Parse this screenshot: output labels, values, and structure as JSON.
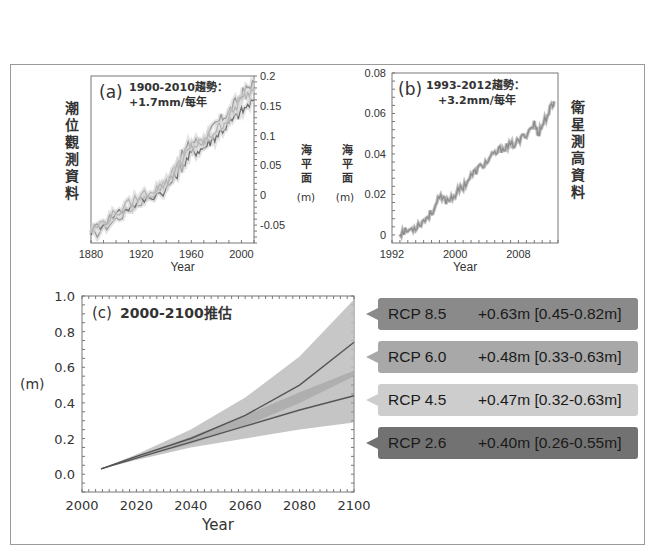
{
  "chart_data": [
    {
      "id": "a",
      "type": "line",
      "panel_label": "(a)",
      "title": "1900-2010趨勢：",
      "subtitle": "+1.7mm/每年",
      "left_vertical_label": "潮位觀測資料",
      "right_axis_label": "海平面",
      "right_axis_unit": "(m)",
      "xlabel": "Year",
      "xticks": [
        "1880",
        "1920",
        "1960",
        "2000"
      ],
      "xlim": [
        1880,
        2010
      ],
      "yticks": [
        "0.2",
        "0.15",
        "0.1",
        "0.05",
        "0",
        "-0.05"
      ],
      "ylim": [
        -0.08,
        0.2
      ],
      "y_axis_side": "right",
      "series": [
        {
          "name": "tide gauge record 1",
          "x": [
            1880,
            1900,
            1920,
            1940,
            1950,
            1960,
            1970,
            1980,
            1990,
            2000,
            2010
          ],
          "values": [
            -0.07,
            -0.04,
            -0.01,
            0.02,
            0.06,
            0.09,
            0.09,
            0.12,
            0.14,
            0.17,
            0.19
          ]
        },
        {
          "name": "tide gauge record 2",
          "x": [
            1880,
            1900,
            1920,
            1940,
            1950,
            1960,
            1970,
            1980,
            1990,
            2000,
            2010
          ],
          "values": [
            -0.06,
            -0.03,
            -0.01,
            0.01,
            0.04,
            0.07,
            0.08,
            0.1,
            0.12,
            0.14,
            0.16
          ]
        },
        {
          "name": "tide gauge record 3",
          "x": [
            1880,
            1900,
            1920,
            1940,
            1950,
            1960,
            1970,
            1980,
            1990,
            2000,
            2010
          ],
          "values": [
            -0.06,
            -0.03,
            0.0,
            0.02,
            0.05,
            0.08,
            0.09,
            0.11,
            0.13,
            0.16,
            0.18
          ]
        }
      ]
    },
    {
      "id": "b",
      "type": "line",
      "panel_label": "(b)",
      "title": "1993-2012趨勢：",
      "subtitle": "+3.2mm/每年",
      "left_axis_label": "海平面",
      "left_axis_unit": "(m)",
      "right_vertical_label": "衛星測高資料",
      "xlabel": "Year",
      "xticks": [
        "1992",
        "2000",
        "2008"
      ],
      "xlim": [
        1992,
        2013
      ],
      "yticks": [
        "0.08",
        "0.06",
        "0.04",
        "0.02",
        "0"
      ],
      "ylim": [
        -0.004,
        0.08
      ],
      "series": [
        {
          "name": "satellite altimetry",
          "x": [
            1993,
            1994,
            1995,
            1996,
            1997,
            1998,
            1999,
            2000,
            2001,
            2002,
            2003,
            2004,
            2005,
            2006,
            2007,
            2008,
            2009,
            2010,
            2010.5,
            2011,
            2012,
            2012.5
          ],
          "values": [
            0.001,
            0.002,
            0.004,
            0.007,
            0.011,
            0.018,
            0.017,
            0.02,
            0.024,
            0.029,
            0.033,
            0.036,
            0.04,
            0.043,
            0.044,
            0.046,
            0.05,
            0.055,
            0.05,
            0.054,
            0.062,
            0.066
          ]
        }
      ]
    },
    {
      "id": "c",
      "type": "area",
      "panel_label": "(c)",
      "title": "2000-2100推估",
      "ylabel": "(m)",
      "xlabel": "Year",
      "xticks": [
        "2000",
        "2020",
        "2040",
        "2060",
        "2080",
        "2100"
      ],
      "xlim": [
        2000,
        2100
      ],
      "yticks": [
        "1.0",
        "0.8",
        "0.6",
        "0.4",
        "0.2",
        "0.0"
      ],
      "ylim": [
        -0.1,
        1.0
      ],
      "series": [
        {
          "name": "RCP 8.5",
          "x": [
            2007,
            2020,
            2040,
            2060,
            2080,
            2100
          ],
          "values": [
            0.03,
            0.1,
            0.2,
            0.33,
            0.5,
            0.74
          ],
          "low": [
            0.03,
            0.09,
            0.17,
            0.27,
            0.4,
            0.55
          ],
          "high": [
            0.03,
            0.11,
            0.25,
            0.43,
            0.66,
            0.98
          ]
        },
        {
          "name": "RCP 2.6",
          "x": [
            2007,
            2020,
            2040,
            2060,
            2080,
            2100
          ],
          "values": [
            0.03,
            0.09,
            0.18,
            0.27,
            0.36,
            0.44
          ],
          "low": [
            0.03,
            0.08,
            0.15,
            0.2,
            0.25,
            0.29
          ],
          "high": [
            0.03,
            0.1,
            0.21,
            0.33,
            0.46,
            0.58
          ]
        }
      ],
      "annotations": [
        {
          "scenario": "RCP 8.5",
          "mean": "+0.63m",
          "range": "[0.45-0.82m]",
          "color": "#8a8a8a"
        },
        {
          "scenario": "RCP 6.0",
          "mean": "+0.48m",
          "range": "[0.33-0.63m]",
          "color": "#a8a8a8"
        },
        {
          "scenario": "RCP 4.5",
          "mean": "+0.47m",
          "range": "[0.32-0.63m]",
          "color": "#cdcdcd"
        },
        {
          "scenario": "RCP 2.6",
          "mean": "+0.40m",
          "range": "[0.26-0.55m]",
          "color": "#727272"
        }
      ]
    }
  ],
  "callouts": [
    {
      "scenario": "RCP 8.5",
      "value": "+0.63m [0.45-0.82m]"
    },
    {
      "scenario": "RCP 6.0",
      "value": "+0.48m [0.33-0.63m]"
    },
    {
      "scenario": "RCP 4.5",
      "value": "+0.47m [0.32-0.63m]"
    },
    {
      "scenario": "RCP 2.6",
      "value": "+0.40m [0.26-0.55m]"
    }
  ]
}
